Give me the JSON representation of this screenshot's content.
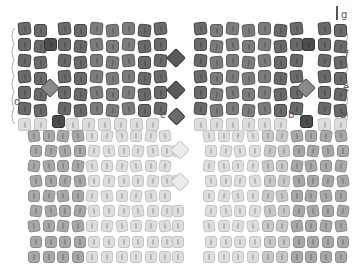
{
  "diagram": {
    "type": "beadwork-pattern",
    "colors": {
      "dark_bead": "#6a6a6a",
      "dark_bead_border": "#4a4a4a",
      "accent_bead": "#4d4d4d",
      "light_bead": "#c8c8c8",
      "light_bead_border": "#aeaeae",
      "pale_bead": "#dedede",
      "pale_bead_border": "#c4c4c4",
      "mid_bead": "#a8a8a8",
      "mid_bead_border": "#8e8e8e",
      "thread": "#9a9a9a",
      "background": "#ffffff"
    },
    "labels": [
      {
        "id": "a",
        "text": "a",
        "x": 340,
        "y": 110
      },
      {
        "id": "b",
        "text": "b",
        "x": 288,
        "y": 110
      },
      {
        "id": "c",
        "text": "c",
        "x": 160,
        "y": 110
      },
      {
        "id": "d",
        "text": "d",
        "x": 14,
        "y": 97
      },
      {
        "id": "e",
        "text": "e",
        "x": 343,
        "y": 83
      },
      {
        "id": "f",
        "text": "f",
        "x": 345,
        "y": 50
      },
      {
        "id": "g",
        "text": "g",
        "x": 341,
        "y": 10
      }
    ],
    "upper_section": {
      "rows": 6,
      "description": "Dark peyote beads in panels with crystal diamond accents between panels",
      "panels": [
        {
          "name": "left-edge",
          "columns": 2,
          "x": 20
        },
        {
          "name": "left-main",
          "columns": 4,
          "x": 58
        },
        {
          "name": "left-center",
          "columns": 4,
          "x": 95
        },
        {
          "name": "right-center",
          "columns": 6,
          "x": 192
        },
        {
          "name": "right-main",
          "columns": 3,
          "x": 248
        },
        {
          "name": "right-edge",
          "columns": 2,
          "x": 316
        }
      ]
    },
    "lower_section": {
      "rows": 9,
      "columns": 22,
      "description": "Light bead fan with mid-tone side columns"
    }
  }
}
